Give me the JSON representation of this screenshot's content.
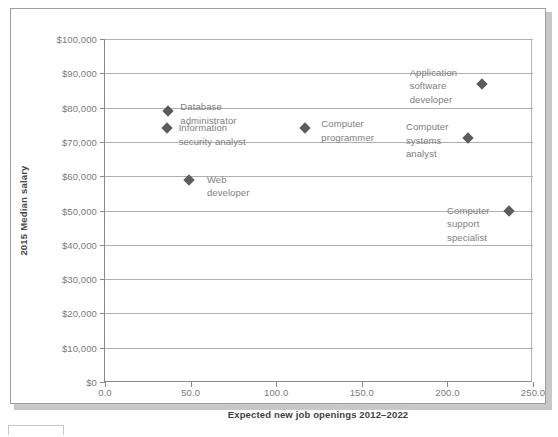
{
  "figure": {
    "background_color": "#ffffff",
    "frame_color": "#9d9d9d",
    "marker_color": "#5c5c5c",
    "gridline_color": "#b0b0b0",
    "label_color": "#7e7e7e"
  },
  "chart_data": {
    "type": "scatter",
    "title": "",
    "xlabel": "Expected new job openings 2012–2022",
    "ylabel": "2015 Median salary",
    "xlim": [
      0,
      250
    ],
    "ylim": [
      0,
      100000
    ],
    "grid": true,
    "legend": "none",
    "xticks": [
      0,
      50,
      100,
      150,
      200,
      250
    ],
    "xtick_labels": [
      "0.0",
      "50.0",
      "100.0",
      "150.0",
      "200.0",
      "250.0"
    ],
    "yticks": [
      0,
      10000,
      20000,
      30000,
      40000,
      50000,
      60000,
      70000,
      80000,
      90000,
      100000
    ],
    "ytick_labels": [
      "$0",
      "$10,000",
      "$20,000",
      "$30,000",
      "$40,000",
      "$50,000",
      "$60,000",
      "$70,000",
      "$80,000",
      "$90,000",
      "$100,000"
    ],
    "points": [
      {
        "name": "database-administrator",
        "label": "Database\nadministrator",
        "x": 37,
        "y": 79000,
        "label_dx": 12,
        "label_dy": -11
      },
      {
        "name": "information-security-analyst",
        "label": "Information\nsecurity analyst",
        "x": 36,
        "y": 74000,
        "label_dx": 12,
        "label_dy": -7
      },
      {
        "name": "web-developer",
        "label": "Web\ndeveloper",
        "x": 49,
        "y": 59000,
        "label_dx": 18,
        "label_dy": -7
      },
      {
        "name": "computer-programmer",
        "label": "Computer\nprogrammer",
        "x": 117,
        "y": 74000,
        "label_dx": 16,
        "label_dy": -11
      },
      {
        "name": "application-software-developer",
        "label": "Application\nsoftware\ndeveloper",
        "x": 220,
        "y": 87000,
        "label_dx": -72,
        "label_dy": -18
      },
      {
        "name": "computer-systems-analyst",
        "label": "Computer\nsystems\nanalyst",
        "x": 212,
        "y": 71000,
        "label_dx": -62,
        "label_dy": -18
      },
      {
        "name": "computer-support-specialist",
        "label": "Computer\nsupport\nspecialist",
        "x": 236,
        "y": 50000,
        "label_dx": -62,
        "label_dy": -7
      }
    ]
  }
}
